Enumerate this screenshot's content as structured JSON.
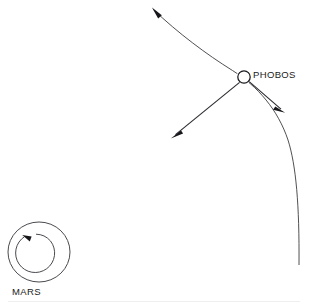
{
  "figure": {
    "kind": "orbital-mechanics-line-diagram",
    "background_color": "#ffffff",
    "ink_color": "#17171b",
    "width": 309,
    "height": 305
  },
  "labels": {
    "phobos": "PHOBOS",
    "mars": "MARS"
  },
  "bodies": {
    "phobos": {
      "name": "PHOBOS",
      "center_x": 244,
      "center_y": 77,
      "radius": 6.2,
      "style": "open-circle"
    },
    "mars": {
      "name": "MARS",
      "center_x": 39,
      "center_y": 252,
      "radius_x": 31,
      "radius_y": 30,
      "style": "open-circle-with-rotation-arrow",
      "rotation_sense": "counterclockwise"
    }
  },
  "orbit": {
    "name": "phobos-orbit-arc",
    "direction_arrow": "up-left-at-top-end",
    "top_end_x": 152,
    "top_end_y": 8,
    "bottom_end_x": 299,
    "bottom_end_y": 266
  },
  "vectors": [
    {
      "id": "radial-vector",
      "name": "radial-arrow-toward-mars",
      "from_x": 240,
      "from_y": 83,
      "to_x": 172,
      "to_y": 138,
      "arrowhead": "at-tip"
    },
    {
      "id": "tangential-vector",
      "name": "tangential-velocity-arrow",
      "from_x": 249,
      "from_y": 82,
      "to_x": 285,
      "to_y": 113,
      "arrowhead": "at-tip"
    },
    {
      "id": "orbit-direction-vector",
      "name": "orbit-direction-arrow",
      "from_x": 175,
      "from_y": 30,
      "to_x": 152,
      "to_y": 8,
      "arrowhead": "at-tip"
    },
    {
      "id": "mars-spin-vector",
      "name": "mars-rotation-arrow",
      "sense": "counterclockwise",
      "arrowhead": "at-upper-left"
    }
  ]
}
